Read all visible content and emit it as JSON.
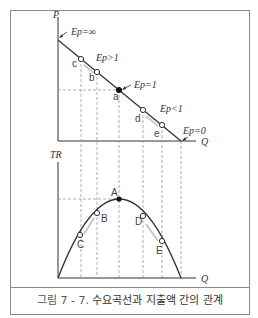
{
  "caption": {
    "figure_number": "그림 7 - 7.",
    "title": "수요곡선과 지출액 간의 관계"
  },
  "top_panel": {
    "y_axis_label": "P",
    "x_axis_label": "Q",
    "elasticity_labels": {
      "infinite": "Ep=∞",
      "elastic": "Ep>1",
      "unit": "Ep=1",
      "inelastic": "Ep<1",
      "zero": "Ep=0"
    },
    "points": [
      "c",
      "b",
      "a",
      "d",
      "e"
    ]
  },
  "bottom_panel": {
    "y_axis_label": "TR",
    "x_axis_label": "Q",
    "points": [
      "A",
      "B",
      "C",
      "D",
      "E"
    ]
  },
  "colors": {
    "line": "#333333",
    "dashed": "#9a9a9a",
    "segment_highlight": "#c8c8c8",
    "frame": "#8a8a8a"
  }
}
